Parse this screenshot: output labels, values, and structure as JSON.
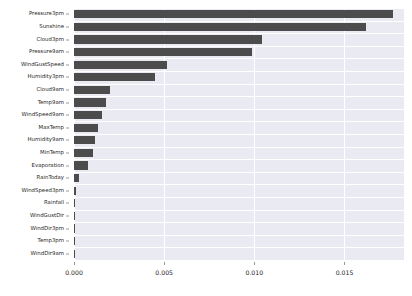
{
  "chart_data": {
    "type": "bar",
    "orientation": "horizontal",
    "title": "",
    "xlabel": "",
    "ylabel": "",
    "xlim": [
      0.0,
      0.0183
    ],
    "grid": true,
    "legend": null,
    "xticks": [
      "0.000",
      "0.005",
      "0.010",
      "0.015"
    ],
    "xtick_values": [
      0.0,
      0.005,
      0.01,
      0.015
    ],
    "categories": [
      "Pressure3pm",
      "Sunshine",
      "Cloud3pm",
      "Pressure9am",
      "WindGustSpeed",
      "Humidity3pm",
      "Cloud9am",
      "Temp9am",
      "WindSpeed9am",
      "MaxTemp",
      "Humidity9am",
      "MinTemp",
      "Evaporation",
      "RainToday",
      "WindSpeed3pm",
      "Rainfall",
      "WindGustDir",
      "WindDir3pm",
      "Temp3pm",
      "WindDir9am"
    ],
    "values": [
      0.01768,
      0.01618,
      0.01043,
      0.00988,
      0.00516,
      0.00448,
      0.00198,
      0.00178,
      0.00158,
      0.00133,
      0.00119,
      0.00107,
      0.00078,
      0.00029,
      0.00011,
      6e-05,
      5e-05,
      5e-05,
      4e-05,
      4e-05
    ],
    "bar_color": "#4c4c4c",
    "panel_color": "#eaeaf2",
    "grid_color": "#ffffff"
  }
}
